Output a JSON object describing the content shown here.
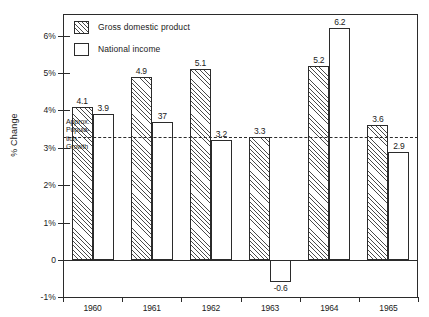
{
  "chart_data": {
    "type": "bar",
    "title": "",
    "subtitle": "",
    "xlabel": "",
    "ylabel": "% Change",
    "categories": [
      "1960",
      "1961",
      "1962",
      "1963",
      "1964",
      "1965"
    ],
    "series": [
      {
        "name": "Gross domestic product",
        "values": [
          4.1,
          4.9,
          5.1,
          3.3,
          5.2,
          3.6
        ]
      },
      {
        "name": "National income",
        "values": [
          3.9,
          3.7,
          3.2,
          -0.6,
          6.2,
          2.9
        ]
      }
    ],
    "value_labels": {
      "Gross domestic product": [
        "4.1",
        "4.9",
        "5.1",
        "3.3",
        "5.2",
        "3.6"
      ],
      "National income": [
        "3.9",
        "37",
        "3.2",
        "-0.6",
        "6.2",
        "2.9"
      ]
    },
    "ylim": [
      -1,
      6.4
    ],
    "yticks": [
      -1,
      0,
      1,
      2,
      3,
      4,
      5,
      6
    ],
    "ytick_labels": [
      "-1%",
      "0",
      "1%",
      "2%",
      "3%",
      "4%",
      "5%",
      "6%"
    ],
    "grid": false,
    "legend_position": "top-left",
    "annotations": [
      {
        "name": "approx-population-growth",
        "lines": [
          "Approx.",
          "Popula-",
          "tion",
          "Growth"
        ],
        "value": 3.3,
        "style": "dashed-horizontal-reference-line"
      }
    ],
    "colors": {
      "ink": "#2b2b2b",
      "hatch": "#4a4a4a",
      "background": "#ffffff"
    }
  },
  "legend": {
    "items": [
      {
        "label": "Gross domestic product",
        "swatch": "hatched"
      },
      {
        "label": "National income",
        "swatch": "empty"
      }
    ]
  }
}
